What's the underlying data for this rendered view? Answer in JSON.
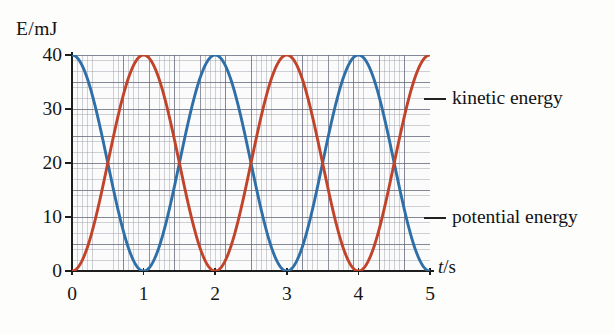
{
  "chart_data": {
    "type": "line",
    "title": "",
    "xlabel": "t/s",
    "ylabel": "E/mJ",
    "xlim": [
      0,
      5
    ],
    "ylim": [
      0,
      40
    ],
    "grid": true,
    "grid_style": "graph-paper",
    "legend_position": "right-callout",
    "x_ticks": [
      "0",
      "1",
      "2",
      "3",
      "4",
      "5"
    ],
    "y_ticks": [
      "0",
      "10",
      "20",
      "30",
      "40"
    ],
    "x_tick_values": [
      0,
      1,
      2,
      3,
      4,
      5
    ],
    "y_tick_values": [
      0,
      10,
      20,
      30,
      40
    ],
    "period_seconds": 2,
    "amplitude_mJ": 20,
    "offset_mJ": 20,
    "total_energy_mJ": 40,
    "series": [
      {
        "name": "kinetic energy",
        "color": "#2f6fa8",
        "formula": "E = 20*(1 + cos(pi*t)) mJ",
        "x": [
          0,
          0.25,
          0.5,
          0.75,
          1,
          1.25,
          1.5,
          1.75,
          2,
          2.25,
          2.5,
          2.75,
          3,
          3.25,
          3.5,
          3.75,
          4,
          4.25,
          4.5,
          4.75,
          5
        ],
        "values": [
          40,
          34.1,
          20,
          5.9,
          0,
          5.9,
          20,
          34.1,
          40,
          34.1,
          20,
          5.9,
          0,
          5.9,
          20,
          34.1,
          40,
          34.1,
          20,
          5.9,
          0
        ]
      },
      {
        "name": "potential energy",
        "color": "#c0432a",
        "formula": "E = 20*(1 - cos(pi*t)) mJ",
        "x": [
          0,
          0.25,
          0.5,
          0.75,
          1,
          1.25,
          1.5,
          1.75,
          2,
          2.25,
          2.5,
          2.75,
          3,
          3.25,
          3.5,
          3.75,
          4,
          4.25,
          4.5,
          4.75,
          5
        ],
        "values": [
          0,
          5.9,
          20,
          34.1,
          40,
          34.1,
          20,
          5.9,
          0,
          5.9,
          20,
          34.1,
          40,
          34.1,
          20,
          5.9,
          0,
          5.9,
          20,
          34.1,
          40
        ]
      }
    ],
    "annotations": [
      {
        "text": "kinetic energy",
        "points_to": "kinetic energy",
        "side": "right",
        "at_y_mJ": 32
      },
      {
        "text": "potential energy",
        "points_to": "potential energy",
        "side": "right",
        "at_y_mJ": 10
      }
    ]
  },
  "axes": {
    "y_title": "E/mJ",
    "x_title_italic": "t",
    "x_title_rest": "/s"
  },
  "colors": {
    "kinetic": "#2f6fa8",
    "potential": "#c0432a",
    "axis": "#1d1d1d",
    "grid_minor": "#787d8c",
    "grid_major": "#464b5f",
    "background": "#fdfdfc",
    "text": "#141414"
  }
}
